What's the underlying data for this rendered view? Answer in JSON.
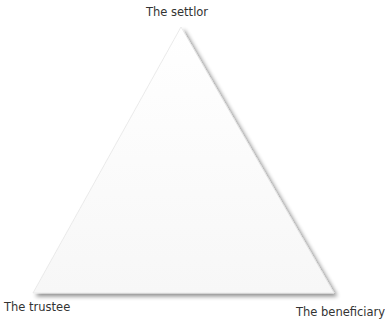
{
  "diagram": {
    "type": "triangle-relationship",
    "vertices": {
      "top": {
        "label": "The settlor"
      },
      "bottom_left": {
        "label": "The trustee"
      },
      "bottom_right": {
        "label": "The beneficiary"
      }
    },
    "colors": {
      "fill": "#ffffff",
      "shadow": "#9a9a9a",
      "text": "#333333"
    }
  }
}
